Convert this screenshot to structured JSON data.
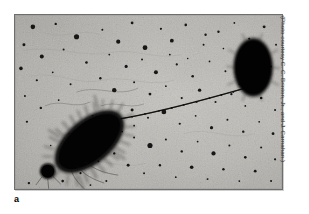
{
  "figure": {
    "panel_letter": "a",
    "photo_credit": "(Photo courtesy C. C. Brinton, Jr., and J. Carnahan.)",
    "frame": {
      "border_color": "#6e6e6e",
      "background_color": "#b9b7b2"
    }
  },
  "micrograph": {
    "kind": "electron-micrograph",
    "subject": "bacterial conjugation",
    "background_tone": "#b8b6b1",
    "cell_color": "#0b0b0b",
    "pilus_color": "#2a2a2a",
    "donor_cell": {
      "label": "fimbriated rod-shaped cell",
      "cx": 75,
      "cy": 128,
      "rx": 40,
      "ry": 20,
      "angle_deg": -40
    },
    "recipient_cell": {
      "label": "smooth oval cell",
      "cx": 254,
      "cy": 67,
      "rx": 18,
      "ry": 28,
      "angle_deg": 0
    },
    "connecting_pilus": {
      "label": "conjugation pilus",
      "x1": 110,
      "y1": 112,
      "x2": 238,
      "y2": 74
    },
    "satellite_blob": {
      "cx": 33,
      "cy": 158,
      "r": 8
    },
    "particle_count": 150
  }
}
